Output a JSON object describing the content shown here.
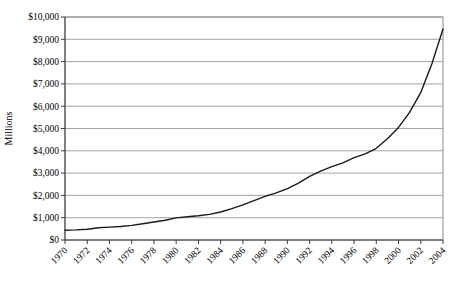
{
  "chart_data": {
    "type": "line",
    "title": "",
    "xlabel": "",
    "ylabel": "Millions",
    "legend": "none",
    "grid": "horizontal",
    "ylim": [
      0,
      10000
    ],
    "y_tick_step": 1000,
    "y_tick_labels": [
      "$0",
      "$1,000",
      "$2,000",
      "$3,000",
      "$4,000",
      "$5,000",
      "$6,000",
      "$7,000",
      "$8,000",
      "$9,000",
      "$10,000"
    ],
    "x_tick_labels": [
      "1970",
      "1972",
      "1974",
      "1976",
      "1978",
      "1980",
      "1982",
      "1984",
      "1986",
      "1988",
      "1990",
      "1992",
      "1994",
      "1996",
      "1998",
      "2000",
      "2002",
      "2004"
    ],
    "categories": [
      1970,
      1971,
      1972,
      1973,
      1974,
      1975,
      1976,
      1977,
      1978,
      1979,
      1980,
      1981,
      1982,
      1983,
      1984,
      1985,
      1986,
      1987,
      1988,
      1989,
      1990,
      1991,
      1992,
      1993,
      1994,
      1995,
      1996,
      1997,
      1998,
      1999,
      2000,
      2001,
      2002,
      2003,
      2004
    ],
    "series": [
      {
        "name": "total",
        "values": [
          440,
          455,
          480,
          545,
          580,
          605,
          655,
          725,
          805,
          890,
          990,
          1040,
          1085,
          1150,
          1255,
          1410,
          1580,
          1765,
          1960,
          2115,
          2300,
          2550,
          2850,
          3090,
          3290,
          3460,
          3690,
          3860,
          4110,
          4540,
          5050,
          5720,
          6620,
          7900,
          9460
        ]
      }
    ],
    "colors": {
      "line": "#1a1a1a",
      "gridline": "#a3a3a3",
      "axis": "#3a3a3a",
      "plot_border": "#8c8c8c",
      "background": "#ffffff",
      "text": "#000000"
    }
  }
}
